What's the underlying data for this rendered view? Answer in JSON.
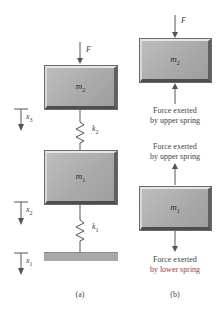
{
  "figure": {
    "panel_a": {
      "caption": "(a)",
      "force_label": "F",
      "upper_mass": {
        "symbol": "m",
        "subscript": "2"
      },
      "lower_mass": {
        "symbol": "m",
        "subscript": "1"
      },
      "upper_spring": {
        "symbol": "k",
        "subscript": "2"
      },
      "lower_spring": {
        "symbol": "k",
        "subscript": "1"
      },
      "displacements": [
        {
          "symbol": "x",
          "subscript": "3"
        },
        {
          "symbol": "x",
          "subscript": "2"
        },
        {
          "symbol": "x",
          "subscript": "1"
        }
      ]
    },
    "panel_b": {
      "caption": "(b)",
      "force_label": "F",
      "upper_mass": {
        "symbol": "m",
        "subscript": "2"
      },
      "lower_mass": {
        "symbol": "m",
        "subscript": "1"
      },
      "upper_mass_bottom_label": [
        "Force exerted",
        "by upper spring"
      ],
      "lower_mass_top_label": [
        "Force exerted",
        "by upper spring"
      ],
      "lower_mass_bottom_label": [
        "Force exerted",
        "by lower spring"
      ]
    },
    "colors": {
      "block": "#a9a9a9",
      "line": "#555555",
      "highlight_text": "#a8383f"
    }
  }
}
